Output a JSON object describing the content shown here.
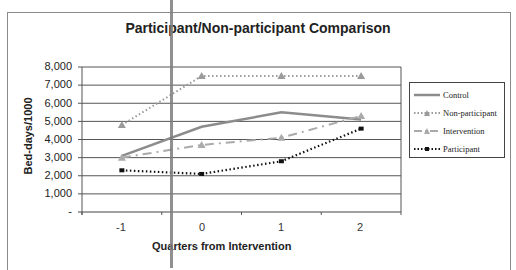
{
  "chart_data": {
    "type": "line",
    "title": "Participant/Non-participant Comparison",
    "xlabel": "Quarters from Intervention",
    "ylabel": "Bed-days/1000",
    "categories": [
      "-1",
      "0",
      "1",
      "2"
    ],
    "yticks": [
      "8,000",
      "7,000",
      "6,000",
      "5,000",
      "4,000",
      "3,000",
      "2,000",
      "1,000",
      "-"
    ],
    "ylim": [
      0,
      8000
    ],
    "grid": true,
    "legend_position": "right",
    "series": [
      {
        "name": "Control",
        "values": [
          3100,
          4700,
          5500,
          5100
        ],
        "color": "#8c8c8c",
        "style": "solid"
      },
      {
        "name": "Non-participant",
        "values": [
          4800,
          7500,
          7500,
          7500
        ],
        "color": "#9a9a9a",
        "style": "dotted-triangle"
      },
      {
        "name": "Intervention",
        "values": [
          3000,
          3700,
          4100,
          5300
        ],
        "color": "#aaaaaa",
        "style": "dashdot-triangle"
      },
      {
        "name": "Participant",
        "values": [
          2300,
          2100,
          2800,
          4600
        ],
        "color": "#111111",
        "style": "dotted"
      }
    ]
  },
  "legend": {
    "items": [
      "Control",
      "Non-participant",
      "Intervention",
      "Participant"
    ]
  }
}
